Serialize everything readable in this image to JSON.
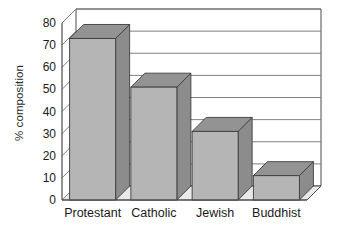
{
  "chart_data": {
    "type": "bar",
    "title": "",
    "subtitle": "",
    "xlabel": "",
    "ylabel": "% composition",
    "categories": [
      "Protestant",
      "Catholic",
      "Jewish",
      "Buddhist"
    ],
    "values": [
      73,
      51,
      31,
      11
    ],
    "series": [
      {
        "name": "% composition",
        "values": [
          73,
          51,
          31,
          11
        ]
      }
    ],
    "ylim": [
      0,
      80
    ],
    "ytick_labels": [
      "0",
      "10",
      "20",
      "30",
      "40",
      "50",
      "60",
      "70",
      "80"
    ],
    "ytick_values": [
      0,
      10,
      20,
      30,
      40,
      50,
      60,
      70,
      80
    ],
    "ytick_step": 10,
    "grid": true,
    "grid_axis": "y",
    "legend": false,
    "legend_position": "none",
    "style": "3d-bar",
    "annotations": [],
    "colors": {
      "bar_front": "#b5b5b5",
      "bar_side": "#8c8c8c",
      "bar_top": "#939393",
      "floor": "#e9e9e9",
      "wall": "#ffffff",
      "grid_line": "#808080",
      "axis_line": "#4a4a4a",
      "text": "#1a1a1a"
    }
  }
}
